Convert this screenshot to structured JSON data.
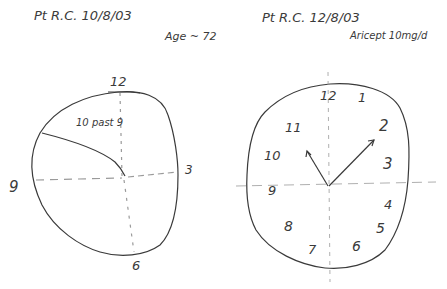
{
  "left_panel": {
    "header": "Pt  R.C.   10/8/03",
    "age": "Age ~ 72",
    "annotation": "10 past 9",
    "numerals": [
      {
        "label": "12",
        "x": 110,
        "y": 72
      },
      {
        "label": "3",
        "x": 185,
        "y": 163
      },
      {
        "label": "9",
        "x": 9,
        "y": 178
      },
      {
        "label": "6",
        "x": 132,
        "y": 258
      }
    ]
  },
  "right_panel": {
    "header": "Pt  R.C.  12/8/03",
    "medication": "Aricept 10mg/d",
    "numerals": [
      {
        "label": "12",
        "x": 320,
        "y": 88
      },
      {
        "label": "1",
        "x": 358,
        "y": 90
      },
      {
        "label": "2",
        "x": 379,
        "y": 117
      },
      {
        "label": "11",
        "x": 285,
        "y": 120
      },
      {
        "label": "10",
        "x": 264,
        "y": 148
      },
      {
        "label": "3",
        "x": 383,
        "y": 155
      },
      {
        "label": "9",
        "x": 268,
        "y": 183
      },
      {
        "label": "4",
        "x": 384,
        "y": 197
      },
      {
        "label": "5",
        "x": 376,
        "y": 220
      },
      {
        "label": "8",
        "x": 284,
        "y": 218
      },
      {
        "label": "6",
        "x": 352,
        "y": 238
      },
      {
        "label": "7",
        "x": 308,
        "y": 242
      }
    ]
  },
  "colors": {
    "ink": "#3a3a3a",
    "guide": "#9a9a9a",
    "paper": "#ffffff"
  }
}
